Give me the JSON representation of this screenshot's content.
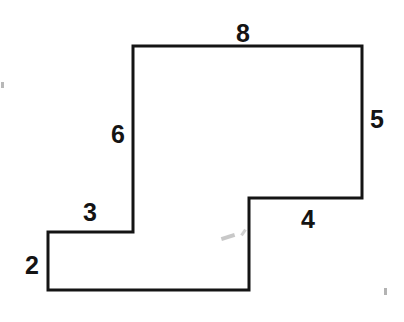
{
  "figure": {
    "stroke_color": "#141414",
    "fill_color": "#ffffff",
    "background_color": "#ffffff",
    "stroke_width": 3,
    "canvas": {
      "width": 404,
      "height": 322
    },
    "polygon_points": "133,46 362,46 362,198 249,198 249,290 48,290 48,232 133,232",
    "vertices": [
      {
        "name": "top-left",
        "x": 133,
        "y": 46
      },
      {
        "name": "top-right",
        "x": 362,
        "y": 46
      },
      {
        "name": "right-step",
        "x": 362,
        "y": 198
      },
      {
        "name": "notch-corner",
        "x": 249,
        "y": 198
      },
      {
        "name": "lower-right",
        "x": 249,
        "y": 290
      },
      {
        "name": "bottom-left",
        "x": 48,
        "y": 290
      },
      {
        "name": "left-step",
        "x": 48,
        "y": 232
      },
      {
        "name": "inner-left",
        "x": 133,
        "y": 232
      }
    ],
    "labels": [
      {
        "id": "top",
        "text": "8",
        "x": 243,
        "y": 33,
        "edge": "top-horizontal"
      },
      {
        "id": "right",
        "text": "5",
        "x": 377,
        "y": 119,
        "edge": "right-vertical"
      },
      {
        "id": "notch-bottom",
        "text": "4",
        "x": 308,
        "y": 219,
        "edge": "notch-horizontal"
      },
      {
        "id": "mid-vertical",
        "text": "6",
        "x": 118,
        "y": 134,
        "edge": "inner-left-vertical"
      },
      {
        "id": "step-top",
        "text": "3",
        "x": 90,
        "y": 212,
        "edge": "step-horizontal"
      },
      {
        "id": "left",
        "text": "2",
        "x": 32,
        "y": 265,
        "edge": "left-vertical"
      }
    ],
    "artifacts": [
      {
        "id": "scan-speck-center",
        "x": 221,
        "y": 235,
        "width": 14,
        "height": 4,
        "rotation": -18,
        "opacity": 0.55
      },
      {
        "id": "scan-speck-tick",
        "x": 240,
        "y": 231,
        "width": 7,
        "height": 3,
        "rotation": -55,
        "opacity": 0.45
      },
      {
        "id": "scan-speck-right",
        "x": 384,
        "y": 288,
        "width": 3,
        "height": 7,
        "rotation": 0,
        "opacity": 0.75
      },
      {
        "id": "scan-speck-edge",
        "x": 1,
        "y": 82,
        "width": 3,
        "height": 6,
        "rotation": 0,
        "opacity": 0.7
      }
    ]
  }
}
